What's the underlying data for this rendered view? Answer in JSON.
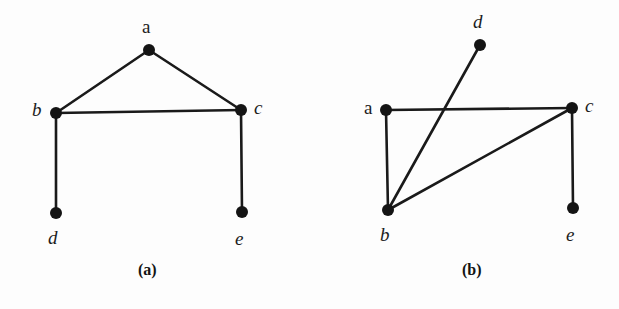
{
  "figure": {
    "background_color": "#fdfdfd",
    "ink_color": "#1c1c1c",
    "edge_color": "#1a1a1a",
    "node_color": "#141414",
    "width": 619,
    "height": 309
  },
  "panels": [
    {
      "id": "a",
      "caption": "(a)",
      "caption_x": 138,
      "caption_y": 262,
      "nodes": [
        {
          "id": "a",
          "label": "a",
          "x": 149,
          "y": 50,
          "r": 6,
          "label_x": 142,
          "label_y": 17,
          "italic": false
        },
        {
          "id": "b",
          "label": "b",
          "x": 56,
          "y": 113,
          "r": 6,
          "label_x": 32,
          "label_y": 100,
          "italic": true
        },
        {
          "id": "c",
          "label": "c",
          "x": 241,
          "y": 110,
          "r": 6,
          "label_x": 254,
          "label_y": 98,
          "italic": true
        },
        {
          "id": "d",
          "label": "d",
          "x": 56,
          "y": 213,
          "r": 6,
          "label_x": 48,
          "label_y": 228,
          "italic": true
        },
        {
          "id": "e",
          "label": "e",
          "x": 242,
          "y": 212,
          "r": 6,
          "label_x": 235,
          "label_y": 229,
          "italic": true
        }
      ],
      "edges": [
        {
          "from": "a",
          "to": "b"
        },
        {
          "from": "a",
          "to": "c"
        },
        {
          "from": "b",
          "to": "c"
        },
        {
          "from": "b",
          "to": "d"
        },
        {
          "from": "c",
          "to": "e"
        }
      ]
    },
    {
      "id": "b",
      "caption": "(b)",
      "caption_x": 152,
      "caption_y": 262,
      "nodes": [
        {
          "id": "d",
          "label": "d",
          "x": 170,
          "y": 45,
          "r": 6,
          "label_x": 163,
          "label_y": 12,
          "italic": true
        },
        {
          "id": "a",
          "label": "a",
          "x": 76,
          "y": 110,
          "r": 6,
          "label_x": 54,
          "label_y": 98,
          "italic": false
        },
        {
          "id": "c",
          "label": "c",
          "x": 262,
          "y": 108,
          "r": 6,
          "label_x": 275,
          "label_y": 96,
          "italic": true
        },
        {
          "id": "b",
          "label": "b",
          "x": 78,
          "y": 210,
          "r": 6,
          "label_x": 70,
          "label_y": 225,
          "italic": true
        },
        {
          "id": "e",
          "label": "e",
          "x": 263,
          "y": 208,
          "r": 6,
          "label_x": 256,
          "label_y": 225,
          "italic": true
        }
      ],
      "edges": [
        {
          "from": "a",
          "to": "b"
        },
        {
          "from": "a",
          "to": "c"
        },
        {
          "from": "b",
          "to": "c"
        },
        {
          "from": "b",
          "to": "d"
        },
        {
          "from": "c",
          "to": "e"
        }
      ]
    }
  ]
}
